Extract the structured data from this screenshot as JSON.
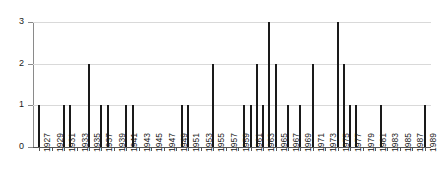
{
  "chart_data": {
    "type": "bar",
    "title": "",
    "subtitle": "",
    "xlabel": "",
    "ylabel": "",
    "ylim": [
      0,
      3
    ],
    "yticks": [
      "0",
      "1",
      "2",
      "3"
    ],
    "grid": true,
    "legend": false,
    "legend_position": "none",
    "xtick_step": 2,
    "xtick_labels": [
      "1927",
      "1929",
      "1931",
      "1933",
      "1935",
      "1937",
      "1939",
      "1941",
      "1943",
      "1945",
      "1947",
      "1949",
      "1951",
      "1953",
      "1955",
      "1957",
      "1959",
      "1961",
      "1963",
      "1965",
      "1967",
      "1969",
      "1971",
      "1973",
      "1975",
      "1977",
      "1979",
      "1981",
      "1983",
      "1985",
      "1987",
      "1989"
    ],
    "xlim": [
      1926,
      1990
    ],
    "categories": [
      1927,
      1928,
      1929,
      1930,
      1931,
      1932,
      1933,
      1934,
      1935,
      1936,
      1937,
      1938,
      1939,
      1940,
      1941,
      1942,
      1943,
      1944,
      1945,
      1946,
      1947,
      1948,
      1949,
      1950,
      1951,
      1952,
      1953,
      1954,
      1955,
      1956,
      1957,
      1958,
      1959,
      1960,
      1961,
      1962,
      1963,
      1964,
      1965,
      1966,
      1967,
      1968,
      1969,
      1970,
      1971,
      1972,
      1973,
      1974,
      1975,
      1976,
      1977,
      1978,
      1979,
      1980,
      1981,
      1982,
      1983,
      1984,
      1985,
      1986,
      1987,
      1988,
      1989
    ],
    "values": [
      1,
      0,
      0,
      0,
      1,
      1,
      0,
      0,
      2,
      0,
      1,
      1,
      0,
      0,
      1,
      1,
      0,
      0,
      0,
      0,
      0,
      0,
      0,
      1,
      1,
      0,
      0,
      0,
      2,
      0,
      0,
      0,
      0,
      1,
      1,
      2,
      1,
      3,
      2,
      0,
      1,
      0,
      1,
      0,
      2,
      0,
      0,
      0,
      3,
      2,
      1,
      1,
      0,
      0,
      0,
      1,
      0,
      0,
      0,
      0,
      0,
      0,
      1
    ],
    "colors": {
      "bar": "#1a1a1a",
      "grid": "#d9d9d9",
      "axis": "#555555",
      "background": "#ffffff",
      "text": "#1a1a1a"
    }
  }
}
